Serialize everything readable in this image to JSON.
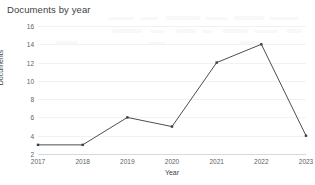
{
  "chart_data": {
    "type": "line",
    "title": "Documents by year",
    "xlabel": "Year",
    "ylabel": "Documents",
    "categories": [
      "2017",
      "2018",
      "2019",
      "2020",
      "2021",
      "2022",
      "2023"
    ],
    "values": [
      3,
      3,
      6,
      5,
      12,
      14,
      4
    ],
    "series": [
      {
        "name": "Documents",
        "values": [
          3,
          3,
          6,
          5,
          12,
          14,
          4
        ]
      }
    ],
    "x_tick_labels": [
      "2017",
      "2018",
      "2019",
      "2020",
      "2021",
      "2022",
      "2023"
    ],
    "y_tick_labels": [
      "16",
      "14",
      "12",
      "10",
      "8",
      "6",
      "4",
      "2"
    ],
    "y_ticks": [
      16,
      14,
      12,
      10,
      8,
      6,
      4,
      2
    ],
    "ylim": [
      2,
      16
    ],
    "xlim": [
      "2017",
      "2023"
    ],
    "grid": true,
    "legend": false,
    "legend_position": "none",
    "line_color": "#4a4e54",
    "marker_color": "#3a3e44",
    "marker_shape": "square",
    "grid_color": "#f2f2f4",
    "background_color": "#ffffff",
    "text_color": "#5a5f66",
    "title_color": "#3b3f45"
  }
}
